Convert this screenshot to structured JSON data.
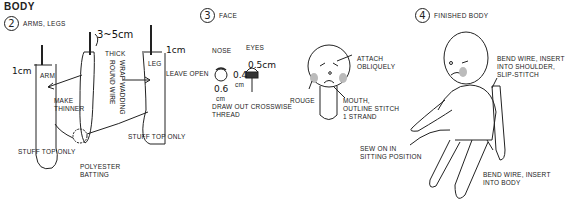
{
  "title": "BODY",
  "steps": [
    {
      "number": "2",
      "label": "ARMS, LEGS"
    },
    {
      "number": "3",
      "label": "FACE"
    },
    {
      "number": "4",
      "label": "FINISHED BODY"
    }
  ],
  "arms_legs": {
    "arm_label": "ARM",
    "arm_measure": "1cm",
    "wire_measure": "3~5cm",
    "thick": "THICK",
    "wrap": "WRAP WADDING",
    "round_wire": "ROUND WIRE",
    "make_thinner_1": "MAKE",
    "make_thinner_2": "THINNER",
    "leg_label": "LEG",
    "leg_measure": "1cm",
    "leave_open": "LEAVE OPEN",
    "stuff_left": "STUFF TOP ONLY",
    "stuff_right": "STUFF TOP ONLY",
    "batting_1": "POLYESTER",
    "batting_2": "BATTING"
  },
  "face": {
    "nose": "NOSE",
    "eyes": "EYES",
    "nose_measure_1": "0.6",
    "nose_measure_2": "cm",
    "eye_width": "0.5cm",
    "eye_height_1": "0.4",
    "eye_height_2": "cm",
    "draw_out_1": "DRAW OUT CROSSWISE",
    "draw_out_2": "THREAD",
    "attach_1": "ATTACH",
    "attach_2": "OBLIQUELY",
    "rouge": "ROUGE",
    "mouth_1": "MOUTH,",
    "mouth_2": "OUTLINE STITCH",
    "mouth_3": "1 STRAND"
  },
  "finished": {
    "shoulder_1": "BEND WIRE, INSERT",
    "shoulder_2": "INTO SHOULDER,",
    "shoulder_3": "SLIP-STITCH",
    "sew_1": "SEW ON IN",
    "sew_2": "SITTING POSITION",
    "body_1": "BEND WIRE, INSERT",
    "body_2": "INTO BODY"
  }
}
